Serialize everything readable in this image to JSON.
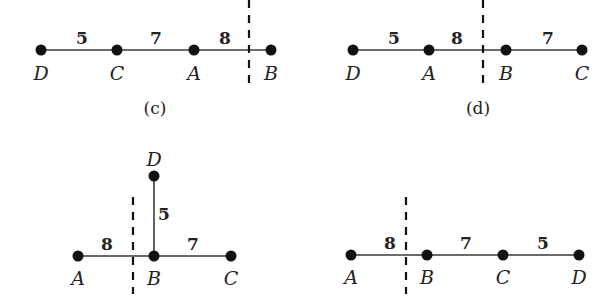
{
  "panels": [
    {
      "id": "c",
      "caption": "(c)",
      "nodes": [
        {
          "name": "D",
          "x": 41,
          "y": 50,
          "lx": 41,
          "ly": 80
        },
        {
          "name": "C",
          "x": 117,
          "y": 50,
          "lx": 117,
          "ly": 80
        },
        {
          "name": "A",
          "x": 194,
          "y": 50,
          "lx": 194,
          "ly": 80
        },
        {
          "name": "B",
          "x": 271,
          "y": 50,
          "lx": 271,
          "ly": 80
        }
      ],
      "edges": [
        {
          "from": "D",
          "to": "C",
          "weight": "5",
          "wx": 82,
          "wy": 44
        },
        {
          "from": "C",
          "to": "A",
          "weight": "7",
          "wx": 156,
          "wy": 44
        },
        {
          "from": "A",
          "to": "B",
          "weight": "8",
          "wx": 225,
          "wy": 44
        }
      ],
      "cut": {
        "x": 249,
        "y1": 0,
        "y2": 90
      },
      "caption_pos": {
        "x": 155,
        "y": 114
      }
    },
    {
      "id": "d",
      "caption": "(d)",
      "nodes": [
        {
          "name": "D",
          "x": 353,
          "y": 50,
          "lx": 353,
          "ly": 80
        },
        {
          "name": "A",
          "x": 429,
          "y": 50,
          "lx": 429,
          "ly": 80
        },
        {
          "name": "B",
          "x": 506,
          "y": 50,
          "lx": 506,
          "ly": 80
        },
        {
          "name": "C",
          "x": 582,
          "y": 50,
          "lx": 582,
          "ly": 80
        }
      ],
      "edges": [
        {
          "from": "D",
          "to": "A",
          "weight": "5",
          "wx": 394,
          "wy": 44
        },
        {
          "from": "A",
          "to": "B",
          "weight": "8",
          "wx": 457,
          "wy": 44
        },
        {
          "from": "B",
          "to": "C",
          "weight": "7",
          "wx": 548,
          "wy": 44
        }
      ],
      "cut": {
        "x": 483,
        "y1": 0,
        "y2": 88
      },
      "caption_pos": {
        "x": 478,
        "y": 114
      }
    },
    {
      "id": "e",
      "caption": "",
      "nodes": [
        {
          "name": "A",
          "x": 78,
          "y": 256,
          "lx": 78,
          "ly": 285
        },
        {
          "name": "B",
          "x": 154,
          "y": 256,
          "lx": 154,
          "ly": 285
        },
        {
          "name": "C",
          "x": 231,
          "y": 256,
          "lx": 231,
          "ly": 285
        },
        {
          "name": "D",
          "x": 154,
          "y": 176,
          "lx": 154,
          "ly": 166
        }
      ],
      "edges": [
        {
          "from": "A",
          "to": "B",
          "weight": "8",
          "wx": 107,
          "wy": 250
        },
        {
          "from": "B",
          "to": "C",
          "weight": "7",
          "wx": 193,
          "wy": 250
        },
        {
          "from": "B",
          "to": "D",
          "weight": "5",
          "wx": 164,
          "wy": 220
        }
      ],
      "cut": {
        "x": 133,
        "y1": 197,
        "y2": 294
      }
    },
    {
      "id": "f",
      "caption": "",
      "nodes": [
        {
          "name": "A",
          "x": 351,
          "y": 255,
          "lx": 351,
          "ly": 284
        },
        {
          "name": "B",
          "x": 427,
          "y": 255,
          "lx": 427,
          "ly": 284
        },
        {
          "name": "C",
          "x": 503,
          "y": 255,
          "lx": 503,
          "ly": 284
        },
        {
          "name": "D",
          "x": 579,
          "y": 255,
          "lx": 579,
          "ly": 284
        }
      ],
      "edges": [
        {
          "from": "A",
          "to": "B",
          "weight": "8",
          "wx": 390,
          "wy": 249
        },
        {
          "from": "B",
          "to": "C",
          "weight": "7",
          "wx": 466,
          "wy": 249
        },
        {
          "from": "C",
          "to": "D",
          "weight": "5",
          "wx": 543,
          "wy": 249
        }
      ],
      "cut": {
        "x": 406,
        "y1": 197,
        "y2": 294
      }
    }
  ]
}
